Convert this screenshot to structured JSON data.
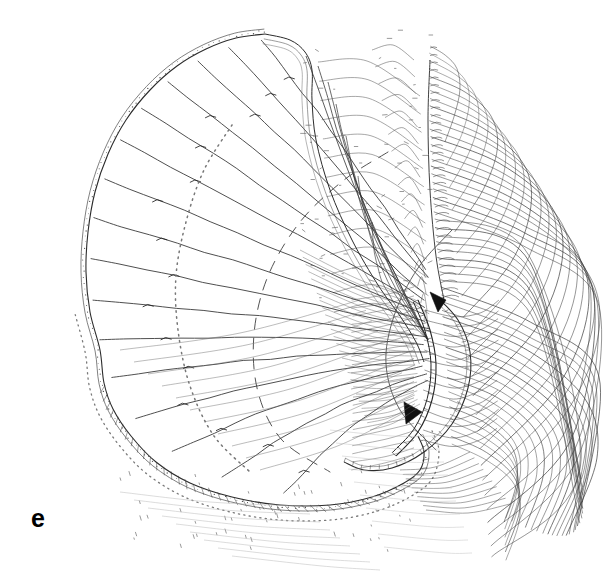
{
  "figure": {
    "panel_label": "e",
    "background_color": "#ffffff",
    "ink_color": "#1a1a1a",
    "width": 610,
    "height": 580,
    "technique": "ink-line-drawing"
  },
  "chart_data": {
    "type": "diagram",
    "title": "",
    "xlabel": "",
    "ylabel": ""
  },
  "drawing": {
    "margin_outline": {
      "name": "wing-margin",
      "stroke": "#2b2b2b",
      "width": 1.1,
      "points": [
        [
          265,
          34
        ],
        [
          236,
          38
        ],
        [
          206,
          49
        ],
        [
          177,
          66
        ],
        [
          150,
          90
        ],
        [
          126,
          120
        ],
        [
          108,
          154
        ],
        [
          95,
          192
        ],
        [
          88,
          232
        ],
        [
          86,
          272
        ],
        [
          90,
          312
        ],
        [
          100,
          350
        ],
        [
          104,
          383
        ],
        [
          113,
          409
        ],
        [
          131,
          436
        ],
        [
          156,
          462
        ],
        [
          190,
          483
        ],
        [
          232,
          497
        ],
        [
          280,
          505
        ],
        [
          330,
          505
        ],
        [
          372,
          497
        ],
        [
          404,
          483
        ],
        [
          420,
          470
        ],
        [
          424,
          452
        ],
        [
          418,
          436
        ]
      ]
    },
    "margin_inner": {
      "name": "wing-margin-inner",
      "stroke": "#4a4a4a",
      "width": 0.7,
      "offset": 5
    },
    "costal_fold": {
      "name": "costal-fold",
      "points": [
        [
          265,
          34
        ],
        [
          290,
          40
        ],
        [
          305,
          52
        ],
        [
          312,
          70
        ],
        [
          312,
          100
        ],
        [
          316,
          140
        ],
        [
          330,
          190
        ],
        [
          352,
          240
        ],
        [
          378,
          285
        ],
        [
          400,
          316
        ],
        [
          416,
          342
        ],
        [
          424,
          362
        ]
      ]
    },
    "radial_veins": {
      "name": "radiating-veins",
      "count": 16,
      "hub": [
        432,
        330
      ],
      "stroke": "#2f2f2f",
      "width": 0.85,
      "tips": [
        [
          262,
          40
        ],
        [
          229,
          47
        ],
        [
          198,
          61
        ],
        [
          168,
          82
        ],
        [
          142,
          108
        ],
        [
          120,
          140
        ],
        [
          104,
          178
        ],
        [
          94,
          218
        ],
        [
          90,
          258
        ],
        [
          92,
          300
        ],
        [
          100,
          340
        ],
        [
          112,
          378
        ],
        [
          136,
          418
        ],
        [
          172,
          452
        ],
        [
          222,
          478
        ],
        [
          284,
          494
        ]
      ]
    },
    "fan_veins_upper": {
      "name": "upper-fan-veins",
      "count": 7,
      "apex": [
        428,
        340
      ],
      "tips": [
        [
          306,
          56
        ],
        [
          318,
          66
        ],
        [
          328,
          82
        ],
        [
          336,
          104
        ],
        [
          346,
          136
        ],
        [
          358,
          176
        ],
        [
          372,
          222
        ]
      ]
    },
    "cross_vein_arcs": [
      {
        "name": "cross-arc-dotted-inner",
        "style": "dotted",
        "points": [
          [
            232,
            125
          ],
          [
            204,
            170
          ],
          [
            186,
            222
          ],
          [
            176,
            276
          ],
          [
            178,
            330
          ],
          [
            190,
            386
          ],
          [
            214,
            436
          ],
          [
            250,
            472
          ]
        ]
      },
      {
        "name": "cross-arc-dashed-outer",
        "style": "dashed",
        "points": [
          [
            388,
            152
          ],
          [
            344,
            180
          ],
          [
            300,
            222
          ],
          [
            268,
            276
          ],
          [
            254,
            334
          ],
          [
            258,
            392
          ],
          [
            282,
            440
          ],
          [
            330,
            472
          ]
        ]
      },
      {
        "name": "cross-arc-solid-mid",
        "style": "solid",
        "points": [
          [
            452,
            230
          ],
          [
            418,
            268
          ],
          [
            394,
            316
          ],
          [
            386,
            364
          ],
          [
            400,
            410
          ],
          [
            436,
            450
          ]
        ]
      }
    ],
    "base_articulation": {
      "name": "wing-base-articulation",
      "wedges": [
        {
          "points": [
            [
              430,
              292
            ],
            [
              446,
              300
            ],
            [
              438,
              312
            ]
          ],
          "fill": "#111111"
        },
        {
          "points": [
            [
              404,
              402
            ],
            [
              422,
              412
            ],
            [
              406,
              424
            ]
          ],
          "fill": "#111111"
        }
      ],
      "scalloped_bar": {
        "points": [
          [
            418,
            300
          ],
          [
            430,
            330
          ],
          [
            436,
            364
          ],
          [
            432,
            400
          ],
          [
            418,
            432
          ],
          [
            396,
            456
          ]
        ],
        "segments": 22
      }
    },
    "vannal_lobe": {
      "name": "vannal-lobe",
      "outline": [
        [
          436,
          296
        ],
        [
          458,
          320
        ],
        [
          470,
          352
        ],
        [
          468,
          388
        ],
        [
          452,
          424
        ],
        [
          424,
          452
        ],
        [
          392,
          468
        ],
        [
          364,
          470
        ],
        [
          344,
          462
        ]
      ],
      "inner_ribs": 14
    },
    "striation_field": {
      "name": "concentric-striation-arcs",
      "count": 54,
      "stroke": "#3a3a3a",
      "width": 0.55,
      "origin": [
        432,
        120
      ],
      "comb_spine": [
        [
          430,
          60
        ],
        [
          428,
          120
        ],
        [
          430,
          190
        ],
        [
          436,
          256
        ],
        [
          444,
          300
        ]
      ],
      "description": "dense nested arcs sweeping from the dorsal spine rightward and around the apical lobe"
    },
    "speckles": {
      "name": "stipple-speckles",
      "count": 62,
      "color": "#555555",
      "description": "scattered short tick marks and dots in the membrane field"
    }
  }
}
